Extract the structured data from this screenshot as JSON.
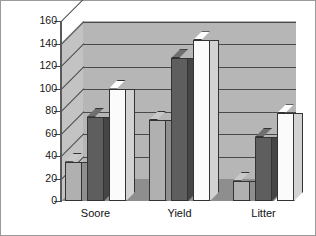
{
  "chart_data": {
    "type": "bar",
    "title": "",
    "subtitle": "",
    "xlabel": "",
    "ylabel": "",
    "categories": [
      "Soore",
      "Yield",
      "Litter"
    ],
    "series": [
      {
        "name": "Series 1",
        "values": [
          35,
          72,
          18
        ],
        "color": "#b0b0b0"
      },
      {
        "name": "Series 2",
        "values": [
          75,
          127,
          57
        ],
        "color": "#5e5e5e"
      },
      {
        "name": "Series 3",
        "values": [
          100,
          143,
          78
        ],
        "color": "#fbfbfb"
      }
    ],
    "ylim": [
      0,
      160
    ],
    "ytick_labels": [
      "160",
      "140",
      "120",
      "100",
      "80",
      "60",
      "40",
      "20",
      "0"
    ],
    "ytick_values": [
      160,
      140,
      120,
      100,
      80,
      60,
      40,
      20,
      0
    ],
    "grid": true,
    "legend": "none",
    "style": "3d-bar",
    "plot_background": "#b6b6b6",
    "floor_color": "#8e8e8e",
    "gridline_color": "#4a4a4a",
    "border_color": "#9a9a9a"
  }
}
